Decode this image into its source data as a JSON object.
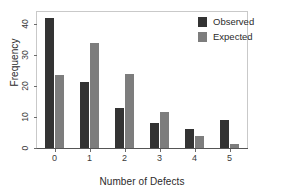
{
  "chart_data": {
    "type": "bar",
    "title": "",
    "xlabel": "Number of Defects",
    "ylabel": "Frequency",
    "categories": [
      "0",
      "1",
      "2",
      "3",
      "4",
      "5"
    ],
    "series": [
      {
        "name": "Observed",
        "color": "#333333",
        "values": [
          42,
          21.5,
          13,
          8,
          6,
          9
        ]
      },
      {
        "name": "Expected",
        "color": "#7d7d7d",
        "values": [
          23.5,
          34,
          24,
          11.5,
          4,
          1.3
        ]
      }
    ],
    "ylim": [
      0,
      44
    ],
    "yticks": [
      0,
      10,
      20,
      30,
      40
    ],
    "ytick_labels": [
      "0",
      "10",
      "20",
      "30",
      "40"
    ],
    "grid": false,
    "legend_position": "top-right",
    "legend_entries": [
      "Observed",
      "Expected"
    ]
  },
  "axes": {
    "y_title": "Frequency",
    "x_title": "Number of Defects"
  },
  "legend": {
    "observed_label": "Observed",
    "expected_label": "Expected"
  }
}
